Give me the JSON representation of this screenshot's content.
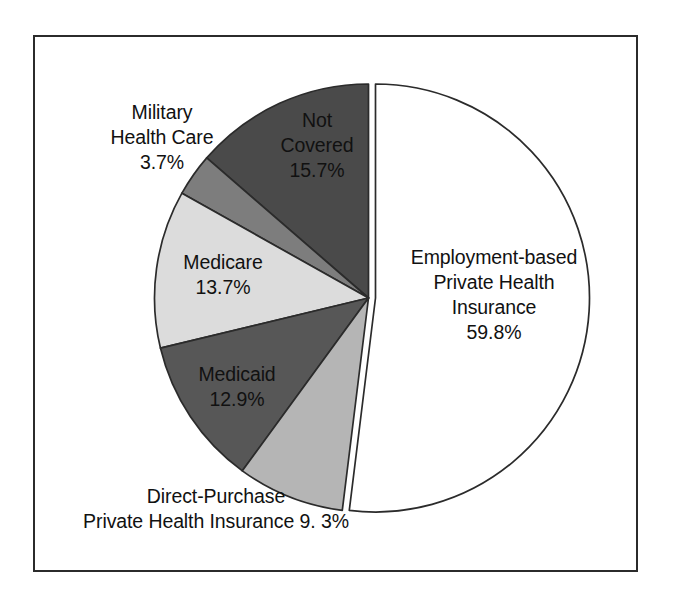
{
  "figure": {
    "background_color": "#ffffff",
    "frame_color": "#2b2b2b"
  },
  "chart_data": {
    "type": "pie",
    "title": "",
    "subtitle": "",
    "xlabel": "",
    "ylabel": "",
    "legend_position": "none",
    "grid": false,
    "units": "percent",
    "total": 115.1,
    "note": "Slice percentages sum to more than 100 because people can be covered by more than one type of health insurance during the year.",
    "categories": [
      "Employment-based Private Health Insurance",
      "Not Covered",
      "Military Health Care",
      "Medicare",
      "Medicaid",
      "Direct-Purchase Private Health Insurance"
    ],
    "values": [
      59.8,
      15.7,
      3.7,
      13.7,
      12.9,
      9.3
    ],
    "slices": [
      {
        "name": "employment-based",
        "label_lines": [
          "Employment-based",
          "Private Health",
          "Insurance"
        ],
        "value_label": "59.8%",
        "value": 59.8,
        "color": "#ffffff",
        "stroke": "#2b2b2b",
        "exploded": true
      },
      {
        "name": "not-covered",
        "label_lines": [
          "Not",
          "Covered"
        ],
        "value_label": "15.7%",
        "value": 15.7,
        "color": "#4a4a4a",
        "stroke": "#2b2b2b",
        "exploded": false
      },
      {
        "name": "military-health-care",
        "label_lines": [
          "Military",
          "Health Care"
        ],
        "value_label": "3.7%",
        "value": 3.7,
        "color": "#7d7d7d",
        "stroke": "#2b2b2b",
        "exploded": false
      },
      {
        "name": "medicare",
        "label_lines": [
          "Medicare"
        ],
        "value_label": "13.7%",
        "value": 13.7,
        "color": "#dcdcdc",
        "stroke": "#2b2b2b",
        "exploded": false
      },
      {
        "name": "medicaid",
        "label_lines": [
          "Medicaid"
        ],
        "value_label": "12.9%",
        "value": 12.9,
        "color": "#575757",
        "stroke": "#2b2b2b",
        "exploded": false
      },
      {
        "name": "direct-purchase",
        "label_lines": [
          "Direct-Purchase",
          "Private Health Insurance 9. 3%"
        ],
        "value_label": "9. 3%",
        "value": 9.3,
        "color": "#b5b5b5",
        "stroke": "#2b2b2b",
        "exploded": false
      }
    ]
  },
  "labels": {
    "military": {
      "line1": "Military",
      "line2": "Health Care",
      "pct": "3.7%"
    },
    "not_covered": {
      "line1": "Not",
      "line2": "Covered",
      "pct": "15.7%"
    },
    "medicare": {
      "line1": "Medicare",
      "pct": "13.7%"
    },
    "medicaid": {
      "line1": "Medicaid",
      "pct": "12.9%"
    },
    "direct_purchase": {
      "line1": "Direct-Purchase",
      "line2": "Private Health Insurance 9. 3%"
    },
    "employment": {
      "line1": "Employment-based",
      "line2": "Private Health",
      "line3": "Insurance",
      "pct": "59.8%"
    }
  }
}
